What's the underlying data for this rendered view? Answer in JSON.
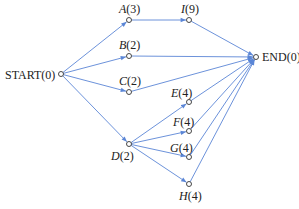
{
  "diagram": {
    "type": "activity-network",
    "edge_color": "#5b86d6",
    "node_color": "#333333",
    "nodes": [
      {
        "id": "START",
        "name": "START",
        "value": "(0)",
        "italic": false,
        "x": 61,
        "y": 74,
        "lx": 5,
        "ly": 69
      },
      {
        "id": "A",
        "name": "A",
        "value": "(3)",
        "italic": true,
        "x": 129,
        "y": 20,
        "lx": 119,
        "ly": 3
      },
      {
        "id": "I",
        "name": "I",
        "value": "(9)",
        "italic": true,
        "x": 189,
        "y": 20,
        "lx": 181,
        "ly": 3
      },
      {
        "id": "B",
        "name": "B",
        "value": "(2)",
        "italic": true,
        "x": 129,
        "y": 56,
        "lx": 119,
        "ly": 39
      },
      {
        "id": "C",
        "name": "C",
        "value": "(2)",
        "italic": true,
        "x": 129,
        "y": 92,
        "lx": 119,
        "ly": 75
      },
      {
        "id": "D",
        "name": "D",
        "value": "(2)",
        "italic": true,
        "x": 129,
        "y": 144,
        "lx": 111,
        "ly": 150
      },
      {
        "id": "E",
        "name": "E",
        "value": "(4)",
        "italic": true,
        "x": 189,
        "y": 102,
        "lx": 171,
        "ly": 87
      },
      {
        "id": "F",
        "name": "F",
        "value": "(4)",
        "italic": true,
        "x": 189,
        "y": 131,
        "lx": 173,
        "ly": 116
      },
      {
        "id": "G",
        "name": "G",
        "value": "(4)",
        "italic": true,
        "x": 189,
        "y": 157,
        "lx": 170,
        "ly": 142
      },
      {
        "id": "H",
        "name": "H",
        "value": "(4)",
        "italic": true,
        "x": 189,
        "y": 184,
        "lx": 179,
        "ly": 190
      },
      {
        "id": "END",
        "name": "END",
        "value": "(0)",
        "italic": false,
        "x": 256,
        "y": 57,
        "lx": 262,
        "ly": 51
      }
    ],
    "edges": [
      {
        "from": "START",
        "to": "A"
      },
      {
        "from": "START",
        "to": "B"
      },
      {
        "from": "START",
        "to": "C"
      },
      {
        "from": "START",
        "to": "D"
      },
      {
        "from": "A",
        "to": "I"
      },
      {
        "from": "I",
        "to": "END"
      },
      {
        "from": "B",
        "to": "END"
      },
      {
        "from": "C",
        "to": "END"
      },
      {
        "from": "D",
        "to": "E"
      },
      {
        "from": "D",
        "to": "F"
      },
      {
        "from": "D",
        "to": "G"
      },
      {
        "from": "D",
        "to": "H"
      },
      {
        "from": "E",
        "to": "END"
      },
      {
        "from": "F",
        "to": "END"
      },
      {
        "from": "G",
        "to": "END"
      },
      {
        "from": "H",
        "to": "END"
      }
    ]
  }
}
